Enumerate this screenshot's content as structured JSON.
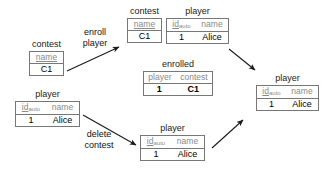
{
  "diagram": {
    "colors": {
      "background": "#ffffff",
      "box_border": "#777777",
      "header_text": "#8a8a8a",
      "value_text": "#000000",
      "arrow": "#1a1a1a",
      "label_text": "#111111"
    },
    "tables": [
      {
        "id": "contest-left",
        "caption": "contest",
        "headers": [
          {
            "text": "name",
            "primary_key": true,
            "subscript": ""
          }
        ],
        "rows": [
          [
            {
              "text": "C1",
              "bold": false
            }
          ]
        ]
      },
      {
        "id": "player-left",
        "caption": "player",
        "headers": [
          {
            "text": "id",
            "primary_key": true,
            "subscript": "auto"
          },
          {
            "text": "name",
            "primary_key": false,
            "subscript": ""
          }
        ],
        "rows": [
          [
            {
              "text": "1",
              "bold": false
            },
            {
              "text": "Alice",
              "bold": false
            }
          ]
        ]
      },
      {
        "id": "contest-top",
        "caption": "contest",
        "headers": [
          {
            "text": "name",
            "primary_key": true,
            "subscript": ""
          }
        ],
        "rows": [
          [
            {
              "text": "C1",
              "bold": false
            }
          ]
        ]
      },
      {
        "id": "player-top",
        "caption": "player",
        "headers": [
          {
            "text": "id",
            "primary_key": true,
            "subscript": "auto"
          },
          {
            "text": "name",
            "primary_key": false,
            "subscript": ""
          }
        ],
        "rows": [
          [
            {
              "text": "1",
              "bold": false
            },
            {
              "text": "Alice",
              "bold": false
            }
          ]
        ]
      },
      {
        "id": "enrolled-middle",
        "caption": "enrolled",
        "headers": [
          {
            "text": "player",
            "primary_key": false,
            "subscript": ""
          },
          {
            "text": "contest",
            "primary_key": false,
            "subscript": ""
          }
        ],
        "rows": [
          [
            {
              "text": "1",
              "bold": true
            },
            {
              "text": "C1",
              "bold": true
            }
          ]
        ]
      },
      {
        "id": "player-bottom",
        "caption": "player",
        "headers": [
          {
            "text": "id",
            "primary_key": true,
            "subscript": "auto"
          },
          {
            "text": "name",
            "primary_key": false,
            "subscript": ""
          }
        ],
        "rows": [
          [
            {
              "text": "1",
              "bold": false
            },
            {
              "text": "Alice",
              "bold": false
            }
          ]
        ]
      },
      {
        "id": "player-right",
        "caption": "player",
        "headers": [
          {
            "text": "id",
            "primary_key": true,
            "subscript": "auto"
          },
          {
            "text": "name",
            "primary_key": false,
            "subscript": ""
          }
        ],
        "rows": [
          [
            {
              "text": "1",
              "bold": false
            },
            {
              "text": "Alice",
              "bold": false
            }
          ]
        ]
      }
    ],
    "edge_labels": [
      {
        "id": "enroll-player",
        "line1": "enroll",
        "line2": "player"
      },
      {
        "id": "delete-contest",
        "line1": "delete",
        "line2": "contest"
      }
    ]
  }
}
